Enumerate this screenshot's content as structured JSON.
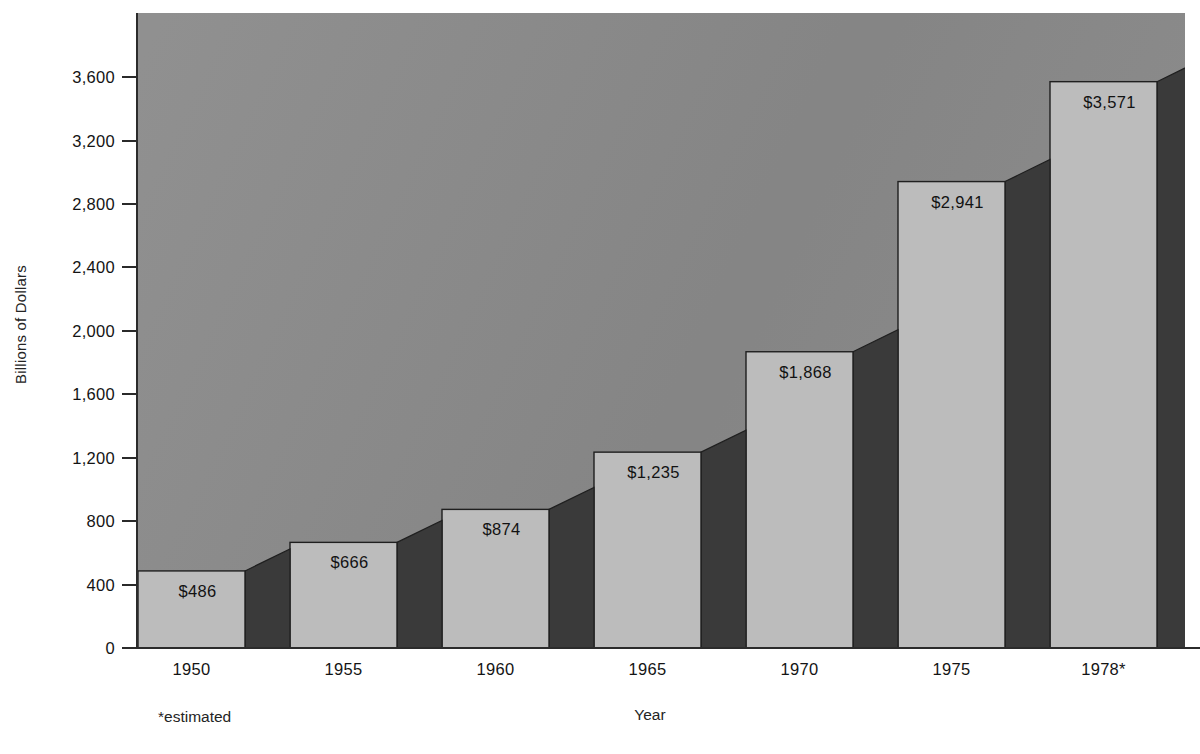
{
  "chart_data": {
    "type": "bar",
    "title": "",
    "xlabel": "Year",
    "ylabel": "Billions of Dollars",
    "categories": [
      "1950",
      "1955",
      "1960",
      "1965",
      "1970",
      "1975",
      "1978*"
    ],
    "values": [
      486,
      666,
      874,
      1235,
      1868,
      2941,
      3571
    ],
    "value_labels": [
      "$486",
      "$666",
      "$874",
      "$1,235",
      "$1,868",
      "$2,941",
      "$3,571"
    ],
    "ylim": [
      0,
      4004
    ],
    "yticks": [
      0,
      400,
      800,
      1200,
      1600,
      2000,
      2400,
      2800,
      3200,
      3600
    ],
    "ytick_labels": [
      "0",
      "400",
      "800",
      "1,200",
      "1,600",
      "2,000",
      "2,400",
      "2,800",
      "3,200",
      "3,600"
    ],
    "grid": false,
    "legend": null,
    "footnote": "*estimated",
    "style": {
      "plot_background": "#8a8a8a",
      "bar_front": "#bcbcbc",
      "bar_side": "#3a3a3a",
      "bar_top": "#a8a8a8",
      "outline": "#1f1f1f",
      "axis": "#2b2b2b",
      "text": "#141414"
    }
  }
}
